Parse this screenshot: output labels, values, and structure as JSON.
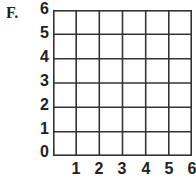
{
  "problem_label": "F.",
  "grid": {
    "columns": 6,
    "rows": 6,
    "line_color": "#333333"
  },
  "axes": {
    "y_ticks": [
      "6",
      "5",
      "4",
      "3",
      "2",
      "1",
      "0"
    ],
    "x_ticks": [
      "1",
      "2",
      "3",
      "4",
      "5",
      "6"
    ]
  }
}
